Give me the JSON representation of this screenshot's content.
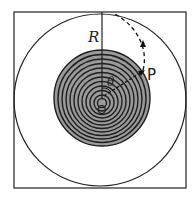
{
  "figure": {
    "labels": {
      "radius": "R",
      "point": "P",
      "origin": "O",
      "angle": "θ"
    },
    "frame": {
      "x": 14,
      "y": 12,
      "w": 172,
      "h": 176
    },
    "outer_circle": {
      "cx": 100,
      "cy": 100,
      "r": 86
    },
    "spiral_disk": {
      "cx": 102,
      "cy": 98,
      "r": 48,
      "rings": 12,
      "fill": "#999999",
      "stroke": "#222222"
    },
    "colors": {
      "line": "#222222",
      "disk_fill": "#9a9a9a"
    }
  }
}
